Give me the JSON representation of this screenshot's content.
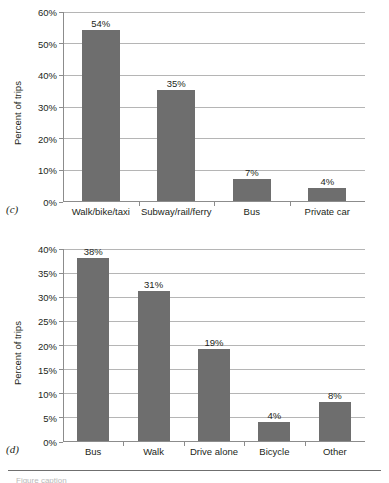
{
  "figures": [
    {
      "panel": "(c)",
      "ylabel": "Percent of trips",
      "yticks": [
        "0%",
        "10%",
        "20%",
        "30%",
        "40%",
        "50%",
        "60%"
      ],
      "categories": [
        "Walk/bike/taxi",
        "Subway/rail/ferry",
        "Bus",
        "Private car"
      ],
      "bar_labels": [
        "54%",
        "35%",
        "7%",
        "4%"
      ]
    },
    {
      "panel": "(d)",
      "ylabel": "Percent of trips",
      "yticks": [
        "0%",
        "5%",
        "10%",
        "15%",
        "20%",
        "25%",
        "30%",
        "35%",
        "40%"
      ],
      "categories": [
        "Bus",
        "Walk",
        "Drive alone",
        "Bicycle",
        "Other"
      ],
      "bar_labels": [
        "38%",
        "31%",
        "19%",
        "4%",
        "8%"
      ]
    }
  ],
  "footer": {
    "clipped_text": "Figure caption"
  },
  "colors": {
    "bar": "#6e6e6e",
    "gridline": "#b5b5b5",
    "axis": "#8c8c8c",
    "text": "#231f20"
  },
  "chart_data": [
    {
      "type": "bar",
      "panel": "(c)",
      "title": "",
      "xlabel": "",
      "ylabel": "Percent of trips",
      "categories": [
        "Walk/bike/taxi",
        "Subway/rail/ferry",
        "Bus",
        "Private car"
      ],
      "values": [
        54,
        35,
        7,
        4
      ],
      "data_labels": [
        "54%",
        "35%",
        "7%",
        "4%"
      ],
      "ylim": [
        0,
        60
      ],
      "ytick_step": 10,
      "ytick_labels": [
        "0%",
        "10%",
        "20%",
        "30%",
        "40%",
        "50%",
        "60%"
      ],
      "grid": true,
      "legend": false
    },
    {
      "type": "bar",
      "panel": "(d)",
      "title": "",
      "xlabel": "",
      "ylabel": "Percent of trips",
      "categories": [
        "Bus",
        "Walk",
        "Drive alone",
        "Bicycle",
        "Other"
      ],
      "values": [
        38,
        31,
        19,
        4,
        8
      ],
      "data_labels": [
        "38%",
        "31%",
        "19%",
        "4%",
        "8%"
      ],
      "ylim": [
        0,
        40
      ],
      "ytick_step": 5,
      "ytick_labels": [
        "0%",
        "5%",
        "10%",
        "15%",
        "20%",
        "25%",
        "30%",
        "35%",
        "40%"
      ],
      "grid": true,
      "legend": false
    }
  ]
}
